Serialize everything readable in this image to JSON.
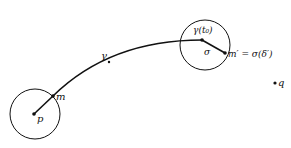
{
  "labels": {
    "p": "p",
    "m": "m",
    "gamma": "γ",
    "gamma_t0": "γ(t₀)",
    "sigma": "σ",
    "m_prime": "m′ = σ(δ′)",
    "q": "q"
  },
  "colors": {
    "stroke": "#111111",
    "background": "#ffffff"
  }
}
